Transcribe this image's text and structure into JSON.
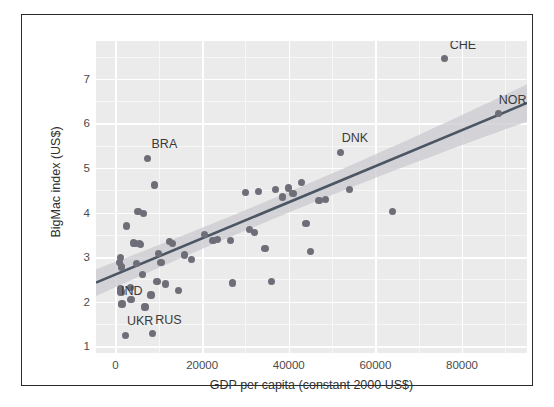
{
  "chart_data": {
    "type": "scatter",
    "title": "",
    "xlabel": "GDP per capita (constant 2000 US$)",
    "ylabel": "BigMac index (US$)",
    "xlim": [
      -4500,
      95000
    ],
    "ylim": [
      0.85,
      7.85
    ],
    "xticks": [
      0,
      20000,
      40000,
      60000,
      80000
    ],
    "xtick_labels": [
      "0",
      "20000",
      "40000",
      "60000",
      "80000"
    ],
    "yticks": [
      1,
      2,
      3,
      4,
      5,
      6,
      7
    ],
    "ytick_labels": [
      "1",
      "2",
      "3",
      "4",
      "5",
      "6",
      "7"
    ],
    "grid": true,
    "legend": "none",
    "point_color": "#6e6e78",
    "line_color": "#4b5563",
    "band_color": "#c9c9cf",
    "panel_background": "#ebebeb",
    "gridline_color": "#ffffff",
    "regression": {
      "type": "linear-fit-with-confidence-band",
      "x_start": -4500,
      "y_start": 2.43,
      "x_end": 95000,
      "y_end": 6.46,
      "band_half_width_start": 0.3,
      "band_half_width_mid": 0.11,
      "band_half_width_end": 0.42
    },
    "points": [
      {
        "x": 1200,
        "y": 3.0,
        "label": ""
      },
      {
        "x": 900,
        "y": 2.88,
        "label": ""
      },
      {
        "x": 1400,
        "y": 2.78,
        "label": ""
      },
      {
        "x": 1100,
        "y": 2.3,
        "label": ""
      },
      {
        "x": 1250,
        "y": 2.22,
        "label": ""
      },
      {
        "x": 1500,
        "y": 1.95,
        "label": "IND"
      },
      {
        "x": 2500,
        "y": 3.7,
        "label": ""
      },
      {
        "x": 2400,
        "y": 1.25,
        "label": "UKR"
      },
      {
        "x": 3400,
        "y": 2.32,
        "label": ""
      },
      {
        "x": 3600,
        "y": 2.05,
        "label": ""
      },
      {
        "x": 4200,
        "y": 3.32,
        "label": ""
      },
      {
        "x": 4500,
        "y": 3.3,
        "label": ""
      },
      {
        "x": 4800,
        "y": 2.85,
        "label": ""
      },
      {
        "x": 5200,
        "y": 4.02,
        "label": ""
      },
      {
        "x": 5600,
        "y": 3.3,
        "label": ""
      },
      {
        "x": 5800,
        "y": 3.28,
        "label": ""
      },
      {
        "x": 6200,
        "y": 2.62,
        "label": ""
      },
      {
        "x": 6500,
        "y": 3.98,
        "label": ""
      },
      {
        "x": 6800,
        "y": 1.88,
        "label": ""
      },
      {
        "x": 7400,
        "y": 5.22,
        "label": "BRA"
      },
      {
        "x": 8200,
        "y": 2.15,
        "label": ""
      },
      {
        "x": 8500,
        "y": 1.28,
        "label": "RUS"
      },
      {
        "x": 9000,
        "y": 4.62,
        "label": ""
      },
      {
        "x": 9600,
        "y": 2.45,
        "label": ""
      },
      {
        "x": 10000,
        "y": 3.08,
        "label": ""
      },
      {
        "x": 10500,
        "y": 2.88,
        "label": ""
      },
      {
        "x": 11500,
        "y": 2.4,
        "label": ""
      },
      {
        "x": 12500,
        "y": 3.36,
        "label": ""
      },
      {
        "x": 13200,
        "y": 3.3,
        "label": ""
      },
      {
        "x": 14500,
        "y": 2.25,
        "label": ""
      },
      {
        "x": 16000,
        "y": 3.05,
        "label": ""
      },
      {
        "x": 17500,
        "y": 2.94,
        "label": ""
      },
      {
        "x": 20500,
        "y": 3.5,
        "label": ""
      },
      {
        "x": 22500,
        "y": 3.38,
        "label": ""
      },
      {
        "x": 23500,
        "y": 3.4,
        "label": ""
      },
      {
        "x": 26500,
        "y": 3.38,
        "label": ""
      },
      {
        "x": 27000,
        "y": 2.42,
        "label": ""
      },
      {
        "x": 30000,
        "y": 4.45,
        "label": ""
      },
      {
        "x": 31000,
        "y": 3.62,
        "label": ""
      },
      {
        "x": 32000,
        "y": 3.55,
        "label": ""
      },
      {
        "x": 33000,
        "y": 4.48,
        "label": ""
      },
      {
        "x": 34500,
        "y": 3.2,
        "label": ""
      },
      {
        "x": 36000,
        "y": 2.46,
        "label": ""
      },
      {
        "x": 37000,
        "y": 4.52,
        "label": ""
      },
      {
        "x": 38500,
        "y": 4.35,
        "label": ""
      },
      {
        "x": 40000,
        "y": 4.55,
        "label": ""
      },
      {
        "x": 41000,
        "y": 4.42,
        "label": ""
      },
      {
        "x": 43000,
        "y": 4.68,
        "label": ""
      },
      {
        "x": 44000,
        "y": 3.75,
        "label": ""
      },
      {
        "x": 45000,
        "y": 3.12,
        "label": ""
      },
      {
        "x": 47000,
        "y": 4.28,
        "label": ""
      },
      {
        "x": 48500,
        "y": 4.3,
        "label": ""
      },
      {
        "x": 52000,
        "y": 5.35,
        "label": "DNK"
      },
      {
        "x": 54000,
        "y": 4.52,
        "label": ""
      },
      {
        "x": 64000,
        "y": 4.02,
        "label": ""
      },
      {
        "x": 76000,
        "y": 7.45,
        "label": "CHE"
      },
      {
        "x": 88500,
        "y": 6.22,
        "label": "NOR"
      }
    ],
    "annotations": [
      {
        "text": "BRA",
        "x": 7400,
        "y": 5.22,
        "dx": 4,
        "dy": -13
      },
      {
        "text": "IND",
        "x": 1500,
        "y": 1.95,
        "dx": -1,
        "dy": -12
      },
      {
        "text": "UKR",
        "x": 2400,
        "y": 1.25,
        "dx": 1,
        "dy": -13
      },
      {
        "text": "RUS",
        "x": 8500,
        "y": 1.28,
        "dx": 3,
        "dy": -13
      },
      {
        "text": "DNK",
        "x": 52000,
        "y": 5.35,
        "dx": 1,
        "dy": -13
      },
      {
        "text": "CHE",
        "x": 76000,
        "y": 7.45,
        "dx": 5,
        "dy": -13
      },
      {
        "text": "NOR",
        "x": 88500,
        "y": 6.22,
        "dx": 0,
        "dy": -13
      }
    ]
  }
}
